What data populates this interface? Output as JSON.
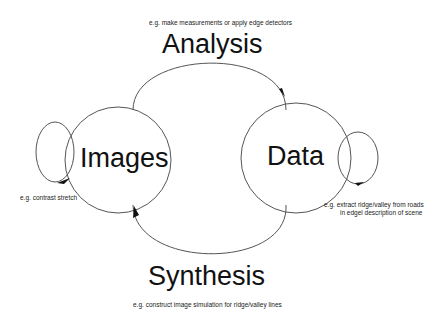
{
  "diagram": {
    "nodes": [
      {
        "id": "images",
        "label": "Images"
      },
      {
        "id": "data",
        "label": "Data"
      }
    ],
    "edges": [
      {
        "id": "analysis",
        "from": "images",
        "to": "data",
        "label": "Analysis",
        "example": "e.g. make measurements or apply edge detectors"
      },
      {
        "id": "synthesis",
        "from": "data",
        "to": "images",
        "label": "Synthesis",
        "example": "e.g. construct image simulation for ridge/valley lines"
      },
      {
        "id": "images-loop",
        "from": "images",
        "to": "images",
        "example": "e.g. contrast stretch"
      },
      {
        "id": "data-loop",
        "from": "data",
        "to": "data",
        "example_line1": "e.g. extract ridge/valley from roads",
        "example_line2": "in edgel description of scene"
      }
    ]
  },
  "colors": {
    "stroke": "#555555",
    "text": "#111111",
    "background": "#ffffff"
  }
}
